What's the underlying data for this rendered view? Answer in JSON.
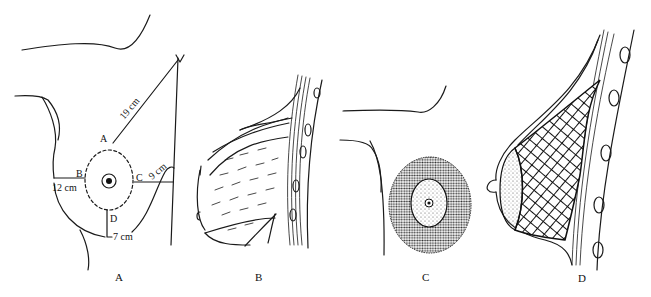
{
  "figure": {
    "panels": [
      {
        "id": "A",
        "label": "A",
        "description": "Frontal view with measurement landmarks",
        "points": {
          "A": "A",
          "B": "B",
          "C": "C",
          "D": "D"
        },
        "measurements": {
          "AtoClavicle": "19 cm",
          "BtoMidline": "12 cm",
          "CtoLateral": "9 cm",
          "DtoFold": "7 cm"
        }
      },
      {
        "id": "B",
        "label": "B",
        "description": "Sagittal cross-section, original tissue"
      },
      {
        "id": "C",
        "label": "C",
        "description": "Frontal view, shaded resection zone around areola"
      },
      {
        "id": "D",
        "label": "D",
        "description": "Sagittal cross-section, cross-hatched resection zone"
      }
    ]
  },
  "colors": {
    "ink": "#1a1a1a",
    "background": "#ffffff",
    "shade": "#555555"
  }
}
